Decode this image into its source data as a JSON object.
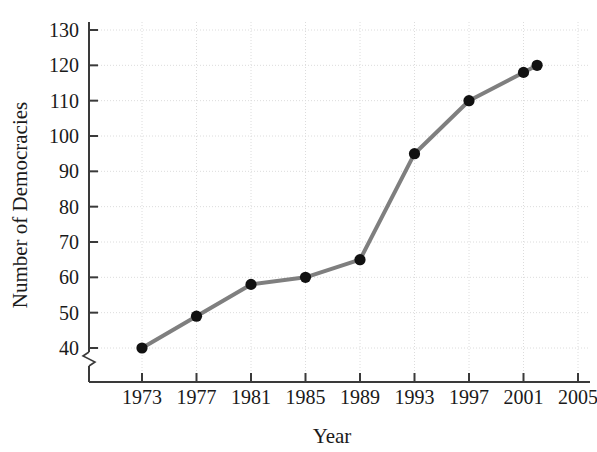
{
  "chart_data": {
    "type": "line",
    "title": "",
    "xlabel": "Year",
    "ylabel": "Number of Democracies",
    "xlim": [
      1971,
      2005
    ],
    "ylim": [
      40,
      130
    ],
    "y_axis_break": true,
    "grid": true,
    "legend": null,
    "line_color": "#7f7f7f",
    "marker_color": "#111111",
    "grid_color": "#dcdcdc",
    "axis_color": "#3a3a3a",
    "x_ticks": [
      1973,
      1977,
      1981,
      1985,
      1989,
      1993,
      1997,
      2001,
      2005
    ],
    "x_tick_labels": [
      "1973",
      "1977",
      "1981",
      "1985",
      "1989",
      "1993",
      "1997",
      "2001",
      "2005"
    ],
    "y_ticks": [
      40,
      50,
      60,
      70,
      80,
      90,
      100,
      110,
      120,
      130
    ],
    "y_tick_labels": [
      "40",
      "50",
      "60",
      "70",
      "80",
      "90",
      "100",
      "110",
      "120",
      "130"
    ],
    "x": [
      1973,
      1977,
      1981,
      1985,
      1989,
      1993,
      1997,
      2001,
      2002
    ],
    "values": [
      40,
      49,
      58,
      60,
      65,
      95,
      110,
      118,
      120
    ],
    "points": [
      {
        "x": 1973,
        "y": 40
      },
      {
        "x": 1977,
        "y": 49
      },
      {
        "x": 1981,
        "y": 58
      },
      {
        "x": 1985,
        "y": 60
      },
      {
        "x": 1989,
        "y": 65
      },
      {
        "x": 1993,
        "y": 95
      },
      {
        "x": 1997,
        "y": 110
      },
      {
        "x": 2001,
        "y": 118
      },
      {
        "x": 2002,
        "y": 120
      }
    ]
  }
}
